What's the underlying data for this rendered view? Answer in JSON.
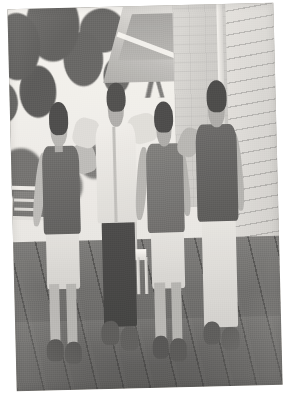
{
  "page": {
    "background_color": "#ffffff",
    "width": 290,
    "height": 404
  },
  "photo": {
    "name": "group-photo",
    "type": "photograph",
    "caption": "Four young men standing together on a wooden porch deck",
    "treatment": "black-and-white, faded, slightly tilted scan",
    "rotation_degrees": -1.4,
    "border": "white scan margin",
    "frame": {
      "left": 12,
      "top": 6,
      "width": 266,
      "height": 382
    },
    "palette": {
      "paper_white": "#ffffff",
      "sky": "#eceae5",
      "foliage_dark": "#3c4038",
      "chimney": "#cbc7bd",
      "siding": "#d2cfc6",
      "deck_wood": "#5d594f",
      "shirt_light": "#eceae4",
      "shirt_dark": "#4c4843",
      "skin": "#b0a79a"
    },
    "scene": {
      "setting": "outdoor porch / deck of a house in summer",
      "background_elements": [
        {
          "name": "tree-canopy",
          "label": "Leafy tree canopy, upper left"
        },
        {
          "name": "tree-branch",
          "label": "Overhanging branch"
        },
        {
          "name": "sky",
          "label": "Bright overcast sky"
        },
        {
          "name": "roof-eave",
          "label": "White roof eave / soffit overhang"
        },
        {
          "name": "chimney",
          "label": "Stucco chimney column"
        },
        {
          "name": "siding",
          "label": "Clapboard siding wall, right side"
        },
        {
          "name": "railing-left",
          "label": "Porch railing, left"
        },
        {
          "name": "railing-middle",
          "label": "White baluster post, center"
        },
        {
          "name": "deck-floor",
          "label": "Weathered wooden deck planks"
        }
      ],
      "subjects": [
        {
          "id": "p1",
          "label": "Young man, far left",
          "position": "far-left",
          "top": "dark short-sleeve t-shirt",
          "bottom": "light khaki shorts",
          "shoes": "dark sneakers",
          "pose": "arm around shoulder of neighbour"
        },
        {
          "id": "p2",
          "label": "Young man, second from left",
          "position": "center-left",
          "top": "light button-up shirt",
          "bottom": "dark trousers",
          "shoes": "dark shoes",
          "pose": "arms around both neighbours, smiling"
        },
        {
          "id": "p3",
          "label": "Young man, third from left",
          "position": "center-right",
          "top": "medium-tone t-shirt",
          "bottom": "light shorts",
          "shoes": "dark sneakers",
          "pose": "standing, arms at sides"
        },
        {
          "id": "p4",
          "label": "Young man, far right",
          "position": "far-right",
          "top": "dark short-sleeve t-shirt",
          "bottom": "light chino trousers",
          "shoes": "dark sneakers",
          "pose": "arm around shoulder of neighbour"
        }
      ]
    }
  }
}
